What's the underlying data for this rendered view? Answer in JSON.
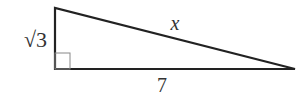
{
  "diagram": {
    "type": "right-triangle",
    "labels": {
      "vertical_leg": "√3",
      "hypotenuse": "x",
      "horizontal_leg": "7"
    },
    "right_angle_marker": true,
    "colors": {
      "stroke": "#222222",
      "marker": "#777777",
      "text": "#333333"
    }
  }
}
